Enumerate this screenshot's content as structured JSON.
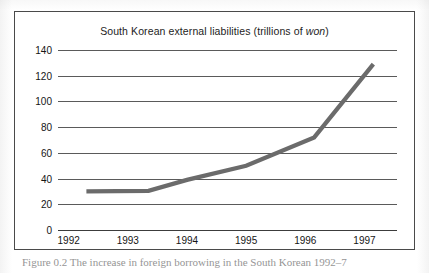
{
  "figure": {
    "caption": "Figure 0.2 The increase in foreign borrowing in the South Korean 1992–7",
    "caption_label": "Figure 0.2"
  },
  "chart_data": {
    "type": "line",
    "title": "South Korean external liabilities (trillions of won)",
    "title_plain": "South Korean external liabilities (trillions of ",
    "title_italic": "won",
    "title_tail": ")",
    "xlabel": "",
    "ylabel": "",
    "categories": [
      "1992",
      "1993",
      "1994",
      "1995",
      "1996",
      "1997"
    ],
    "x_tick_labels": [
      "1992",
      "1993",
      "1994",
      "1995",
      "1996",
      "1997"
    ],
    "y_tick_labels": [
      "140",
      "120",
      "100",
      "80",
      "60",
      "40",
      "20",
      "0"
    ],
    "y_ticks": [
      140,
      120,
      100,
      80,
      60,
      40,
      20,
      0
    ],
    "ylim": [
      0,
      140
    ],
    "xlim": [
      1992,
      1997
    ],
    "grid": true,
    "legend": false,
    "series": [
      {
        "name": "South Korean external liabilities",
        "color": "#6b6b6b",
        "x": [
          1992.3,
          1993.35,
          1994.0,
          1995.0,
          1996.15,
          1997.15
        ],
        "values": [
          30,
          30.5,
          39,
          50,
          72,
          129
        ]
      }
    ]
  },
  "colors": {
    "line": "#6b6b6b",
    "grid": "#5a5a5a",
    "axis": "#3c3c3c",
    "frame": "#4a4a4a",
    "text": "#151515"
  }
}
